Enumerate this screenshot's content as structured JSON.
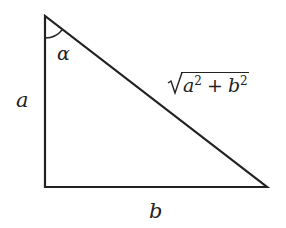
{
  "diagram": {
    "type": "right-triangle",
    "colors": {
      "stroke": "#222222",
      "background": "#ffffff"
    },
    "vertices": {
      "top": [
        45,
        16
      ],
      "right_angle": [
        45,
        187
      ],
      "bottom_right": [
        267,
        187
      ]
    },
    "labels": {
      "vertical_side": "a",
      "horizontal_side": "b",
      "angle": "α",
      "hypotenuse": {
        "var1": "a",
        "exp1": "2",
        "operator": "+",
        "var2": "b",
        "exp2": "2"
      }
    }
  }
}
